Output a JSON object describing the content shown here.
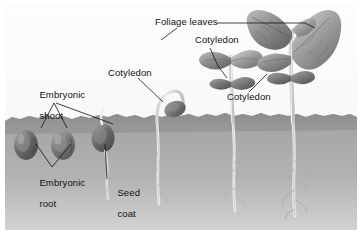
{
  "figure": {
    "kind": "biology-diagram",
    "frame_color": "#ffffff",
    "sky_color": "#fcfcfc",
    "soil_color": "#9a9a9a",
    "soil_line_y": 114,
    "ink_color": "#111111"
  },
  "labels": [
    {
      "id": "foliage-leaves",
      "text": "Foliage leaves",
      "x": 150,
      "y": 18
    },
    {
      "id": "cotyledon-upper",
      "text": "Cotyledon",
      "x": 190,
      "y": 36
    },
    {
      "id": "cotyledon-mid",
      "text": "Cotyledon",
      "x": 103,
      "y": 69
    },
    {
      "id": "cotyledon-right",
      "text": "Cotyledon",
      "x": 222,
      "y": 93
    },
    {
      "id": "embryonic-shoot",
      "line1": "Embryonic",
      "line2": "shoot",
      "x": 18,
      "y": 80
    },
    {
      "id": "embryonic-root",
      "line1": "Embryonic",
      "line2": "root",
      "x": 18,
      "y": 168
    },
    {
      "id": "seed-coat",
      "line1": "Seed",
      "line2": "coat",
      "x": 96,
      "y": 178
    }
  ],
  "stages": [
    {
      "id": "stage-1-dormant-seed-a",
      "name": "dormant seed"
    },
    {
      "id": "stage-2-dormant-seed-b",
      "name": "dormant seed"
    },
    {
      "id": "stage-3-germinating-seed",
      "name": "germinating seed with radicle"
    },
    {
      "id": "stage-4-hypocotyl-arch",
      "name": "hypocotyl arch emerging"
    },
    {
      "id": "stage-5-cotyledons-open",
      "name": "cotyledons opened"
    },
    {
      "id": "stage-6-seedling",
      "name": "seedling with foliage leaves"
    }
  ]
}
